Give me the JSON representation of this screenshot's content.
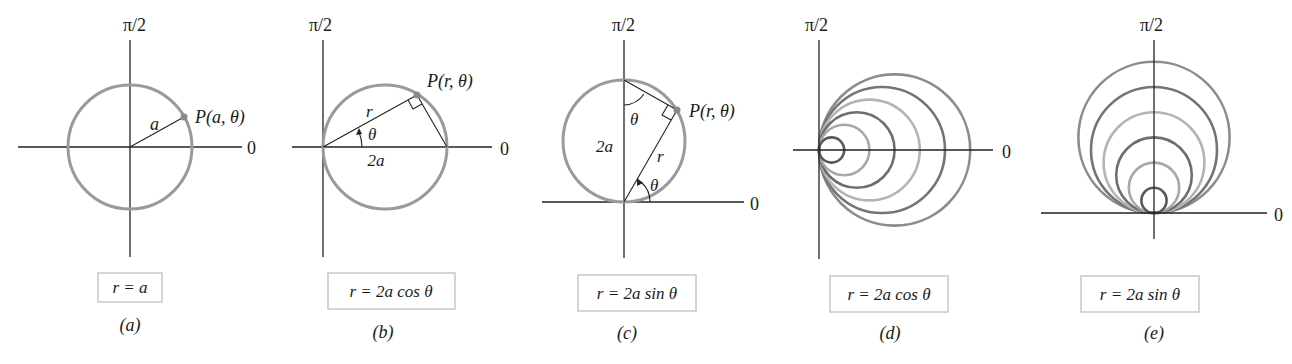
{
  "figure": {
    "panels": [
      {
        "id": "a",
        "caption": "(a)",
        "equation": "r = a",
        "axis_labels": {
          "vertical": "π/2",
          "horizontal": "0"
        },
        "point_label": "P(a, θ)",
        "segment_labels": [
          "a"
        ]
      },
      {
        "id": "b",
        "caption": "(b)",
        "equation": "r = 2a cos θ",
        "axis_labels": {
          "vertical": "π/2",
          "horizontal": "0"
        },
        "point_label": "P(r, θ)",
        "segment_labels": [
          "r",
          "θ",
          "2a"
        ]
      },
      {
        "id": "c",
        "caption": "(c)",
        "equation": "r = 2a sin θ",
        "axis_labels": {
          "vertical": "π/2",
          "horizontal": "0"
        },
        "point_label": "P(r, θ)",
        "segment_labels": [
          "θ",
          "2a",
          "r",
          "θ"
        ]
      },
      {
        "id": "d",
        "caption": "(d)",
        "equation": "r = 2a cos θ",
        "axis_labels": {
          "vertical": "π/2",
          "horizontal": "0"
        },
        "family_relative_sizes": [
          1,
          2,
          3,
          4,
          5,
          6
        ]
      },
      {
        "id": "e",
        "caption": "(e)",
        "equation": "r = 2a sin θ",
        "axis_labels": {
          "vertical": "π/2",
          "horizontal": "0"
        },
        "family_relative_sizes": [
          1,
          2,
          3,
          4,
          5,
          6
        ]
      }
    ],
    "colors": {
      "curve": "#9a9a9a",
      "family_shades": [
        "#5a5a5a",
        "#a8a8a8",
        "#6e6e6e",
        "#b4b4b4",
        "#747474",
        "#8c8c8c"
      ],
      "axis": "#222222",
      "box_border": "#c8c8c8"
    }
  }
}
